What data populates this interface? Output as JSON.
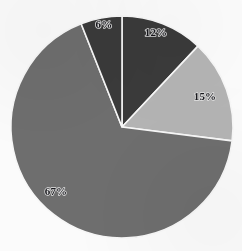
{
  "chart_data": {
    "type": "pie",
    "title": "",
    "subtitle": "",
    "xlabel": "",
    "ylabel": "",
    "legend_position": "none",
    "grid": false,
    "total_percent": 100,
    "start_angle_deg": 0,
    "direction": "clockwise",
    "categories": [
      "Segment 1",
      "Segment 2",
      "Segment 3",
      "Segment 4"
    ],
    "values": [
      12,
      15,
      67,
      6
    ],
    "labels": [
      "12%",
      "15%",
      "67%",
      "6%"
    ],
    "colors": [
      "#3a3a3a",
      "#b4b4b4",
      "#6e6e6e",
      "#3a3a3a"
    ],
    "slices": [
      {
        "label": "12%",
        "value": 12,
        "color": "#3a3a3a",
        "start_deg": 0,
        "end_deg": 43.2,
        "label_x": 156,
        "label_y": 33,
        "label_tone": "dark"
      },
      {
        "label": "15%",
        "value": 15,
        "color": "#b4b4b4",
        "start_deg": 43.2,
        "end_deg": 97.2,
        "label_x": 205,
        "label_y": 97,
        "label_tone": "light"
      },
      {
        "label": "67%",
        "value": 67,
        "color": "#6e6e6e",
        "start_deg": 97.2,
        "end_deg": 338.4,
        "label_x": 56,
        "label_y": 192,
        "label_tone": "light"
      },
      {
        "label": "6%",
        "value": 6,
        "color": "#3a3a3a",
        "start_deg": 338.4,
        "end_deg": 360,
        "label_x": 104,
        "label_y": 25,
        "label_tone": "dark"
      }
    ],
    "geometry": {
      "center_x": 122,
      "center_y": 127,
      "radius": 111
    },
    "background_color": "#fbfbfb",
    "separator_color": "#f7f7f7"
  }
}
